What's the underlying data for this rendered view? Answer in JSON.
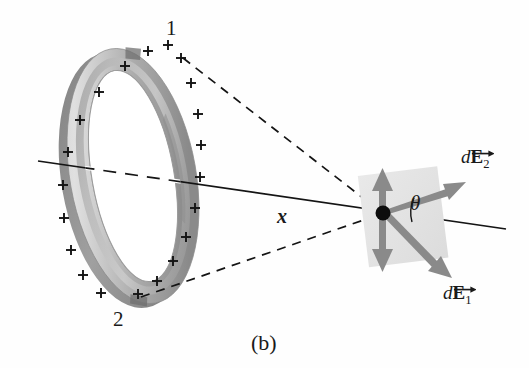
{
  "figure": {
    "caption": "(b)",
    "labels": {
      "point1": "1",
      "point2": "2",
      "axis_distance": "x",
      "angle": "θ",
      "vector1_d": "d",
      "vector1_E": "E",
      "vector1_sub": "1",
      "vector2_d": "d",
      "vector2_E": "E",
      "vector2_sub": "2"
    },
    "colors": {
      "ink": "#1a1a1a",
      "ring_light": "#d8d8d8",
      "ring_mid": "#b4b4b4",
      "ring_dark": "#8d8d8d",
      "ring_darkest": "#6f6f6f",
      "arrow_gray": "#858585",
      "patch_gray": "#e3e3e3",
      "background": "#fefefe"
    },
    "geometry": {
      "ring_center_x": 133,
      "ring_center_y": 176,
      "ring_outer_rx": 63,
      "ring_outer_ry": 129,
      "ring_tilt_deg": -10,
      "field_point_x": 383,
      "field_point_y": 213,
      "point1_x": 183,
      "point1_y": 58,
      "point2_x": 141,
      "point2_y": 297,
      "charge_count": 20,
      "charge_symbol": "+"
    }
  }
}
